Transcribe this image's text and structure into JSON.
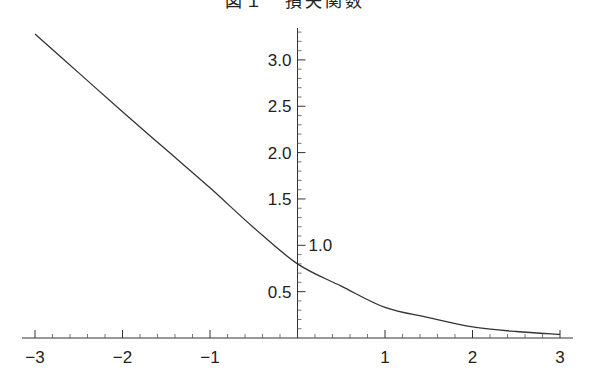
{
  "chart_data": {
    "type": "line",
    "title": "",
    "title_note": "title clipped at top edge; only bottom of glyphs visible",
    "xlabel": "",
    "ylabel": "",
    "xlim": [
      -3,
      3
    ],
    "ylim": [
      0,
      3.3
    ],
    "grid": false,
    "legend": "none",
    "x_ticks": [
      {
        "value": -3,
        "label": "−3"
      },
      {
        "value": -2,
        "label": "−2"
      },
      {
        "value": -1,
        "label": "−1"
      },
      {
        "value": 1,
        "label": "1"
      },
      {
        "value": 2,
        "label": "2"
      },
      {
        "value": 3,
        "label": "3"
      }
    ],
    "x_minor_step": 0.2,
    "y_ticks": [
      {
        "value": 0.5,
        "label": "0.5",
        "side": "left"
      },
      {
        "value": 1.0,
        "label": "1.0",
        "side": "right"
      },
      {
        "value": 1.5,
        "label": "1.5",
        "side": "left"
      },
      {
        "value": 2.0,
        "label": "2.0",
        "side": "left"
      },
      {
        "value": 2.5,
        "label": "2.5",
        "side": "left"
      },
      {
        "value": 3.0,
        "label": "3.0",
        "side": "left"
      }
    ],
    "y_minor_step": 0.1,
    "series": [
      {
        "name": "curve",
        "color": "#333333",
        "x": [
          -3,
          -2.5,
          -2,
          -1.5,
          -1,
          -0.5,
          0,
          0.5,
          1,
          1.5,
          2,
          2.5,
          3
        ],
        "y": [
          3.28,
          2.86,
          2.44,
          2.03,
          1.62,
          1.19,
          0.8,
          0.56,
          0.33,
          0.22,
          0.12,
          0.07,
          0.04
        ]
      }
    ]
  },
  "title_text": "図１　損失関数"
}
